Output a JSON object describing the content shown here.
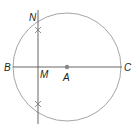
{
  "diagram": {
    "colors": {
      "circle": "#9a9a9a",
      "line": "#555555",
      "point": "#888888",
      "label": "#231f20"
    },
    "circle": {
      "center": "A",
      "cx": 67,
      "cy": 67,
      "r": 54
    },
    "points": [
      {
        "id": "B",
        "label": "B",
        "x": 13,
        "y": 67,
        "label_x": 4,
        "label_y": 71
      },
      {
        "id": "C",
        "label": "C",
        "x": 122,
        "y": 67,
        "label_x": 124,
        "label_y": 71
      },
      {
        "id": "A",
        "label": "A",
        "x": 67,
        "y": 67,
        "label_x": 63,
        "label_y": 80
      },
      {
        "id": "M",
        "label": "M",
        "x": 38,
        "y": 67,
        "label_x": 40,
        "label_y": 78
      },
      {
        "id": "N",
        "label": "N",
        "x": 38,
        "y": 18,
        "label_x": 29,
        "label_y": 21
      }
    ],
    "segments": [
      {
        "name": "diameter-BC",
        "x1": 13,
        "y1": 67,
        "x2": 122,
        "y2": 67
      },
      {
        "name": "perpendicular-line-MN",
        "x1": 38,
        "y1": 10,
        "x2": 38,
        "y2": 124
      }
    ],
    "arc_marks": [
      {
        "name": "upper-arc-intersection",
        "x": 38,
        "y": 30
      },
      {
        "name": "lower-arc-intersection",
        "x": 38,
        "y": 104
      }
    ]
  }
}
